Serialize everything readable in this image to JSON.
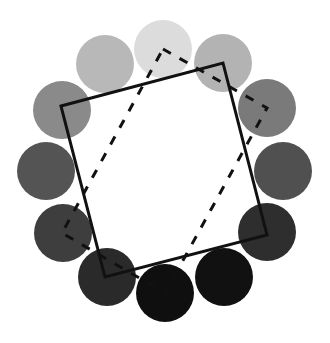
{
  "diagram": {
    "background": "#ffffff",
    "circle_radius": 29,
    "circles": [
      {
        "index": 1,
        "cx": 163,
        "cy": 49,
        "fill": "#dcdcdc"
      },
      {
        "index": 2,
        "cx": 223,
        "cy": 63,
        "fill": "#b3b3b3"
      },
      {
        "index": 3,
        "cx": 267,
        "cy": 108,
        "fill": "#7a7a7a"
      },
      {
        "index": 4,
        "cx": 283,
        "cy": 171,
        "fill": "#505050"
      },
      {
        "index": 5,
        "cx": 267,
        "cy": 232,
        "fill": "#2e2e2e"
      },
      {
        "index": 6,
        "cx": 224,
        "cy": 277,
        "fill": "#111111"
      },
      {
        "index": 7,
        "cx": 165,
        "cy": 293,
        "fill": "#0f0f0f"
      },
      {
        "index": 8,
        "cx": 107,
        "cy": 277,
        "fill": "#2a2a2a"
      },
      {
        "index": 9,
        "cx": 63,
        "cy": 233,
        "fill": "#3e3e3e"
      },
      {
        "index": 10,
        "cx": 46,
        "cy": 171,
        "fill": "#545454"
      },
      {
        "index": 11,
        "cx": 62,
        "cy": 110,
        "fill": "#8a8a8a"
      },
      {
        "index": 12,
        "cx": 105,
        "cy": 64,
        "fill": "#b8b8b8"
      }
    ],
    "solid_square": {
      "points": "61,106 223,63 267,235 105,277",
      "stroke": "#111111",
      "stroke_width": 3
    },
    "dashed_rectangle": {
      "points": "163,49 267,108 165,293 62,233",
      "stroke": "#111111",
      "stroke_width": 3,
      "dasharray": "9 10"
    }
  }
}
